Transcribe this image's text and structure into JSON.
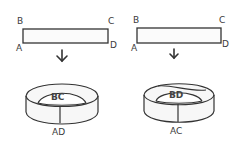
{
  "left_panel": {
    "strip_labels": {
      "B": "B",
      "C": "C",
      "A": "A",
      "D": "D"
    },
    "ring_inner_label": "BC",
    "ring_outer_label": "AD",
    "arrow": "down-arrow-icon"
  },
  "right_panel": {
    "strip_labels": {
      "B": "B",
      "C": "C",
      "A": "A",
      "D": "D"
    },
    "ring_inner_label": "BD",
    "ring_outer_label": "AC",
    "arrow": "down-arrow-icon"
  },
  "colors": {
    "stroke": "#333333",
    "background": "#ffffff"
  }
}
